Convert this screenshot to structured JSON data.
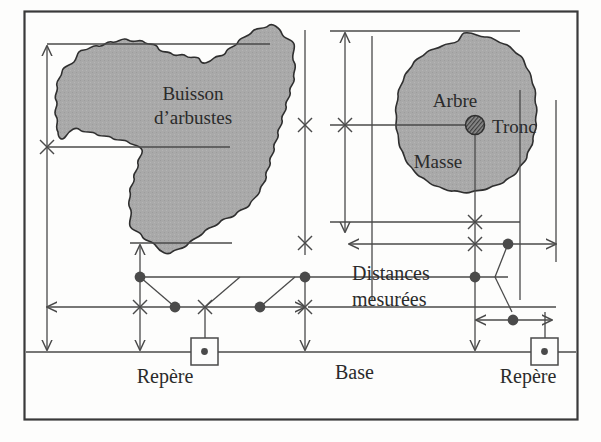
{
  "diagram": {
    "language": "fr",
    "frame": {
      "border_color": "#3a3a3a",
      "background": "#fdfdfc"
    },
    "colors": {
      "vegetation_fill": "#a9a9a9",
      "vegetation_outline": "#2f2f2f",
      "line": "#4a4a4a",
      "text": "#2b2b2b",
      "marker_dot": "#4a4a4a",
      "trunk_fill": "#6f6f6f"
    },
    "labels": {
      "bush": "Buisson",
      "bush_line2": "d’arbustes",
      "tree": "Arbre",
      "tree_mass": "Masse",
      "trunk": "Tronc",
      "distances": "Distances",
      "distances_line2": "mesurées",
      "base": "Base",
      "benchmark_left": "Repère",
      "benchmark_right": "Repère"
    },
    "features": [
      {
        "name": "shrub-thicket",
        "label": "Buisson d’arbustes",
        "kind": "polygon-irregular",
        "fill": "#a9a9a9"
      },
      {
        "name": "tree-crown",
        "label": "Arbre / Masse",
        "kind": "polygon-round",
        "fill": "#a9a9a9"
      },
      {
        "name": "tree-trunk",
        "label": "Tronc",
        "kind": "hatched-circle",
        "fill": "#6f6f6f"
      }
    ],
    "annotations": {
      "base_line": "Base",
      "benchmarks": 2,
      "benchmark_symbol": "square-with-center-dot",
      "offset_markers": "x-cross",
      "station_points": "filled-dot",
      "dimension_style": "arrow-terminated"
    },
    "measurement_rows": [
      {
        "name": "offset-row-upper",
        "symbol": "filled-dot",
        "count": 3
      },
      {
        "name": "offset-row-middle",
        "symbol": "mixed-cross-and-dot",
        "count": 6
      },
      {
        "name": "offset-row-lower-right",
        "symbol": "filled-dot",
        "count": 1
      }
    ]
  }
}
